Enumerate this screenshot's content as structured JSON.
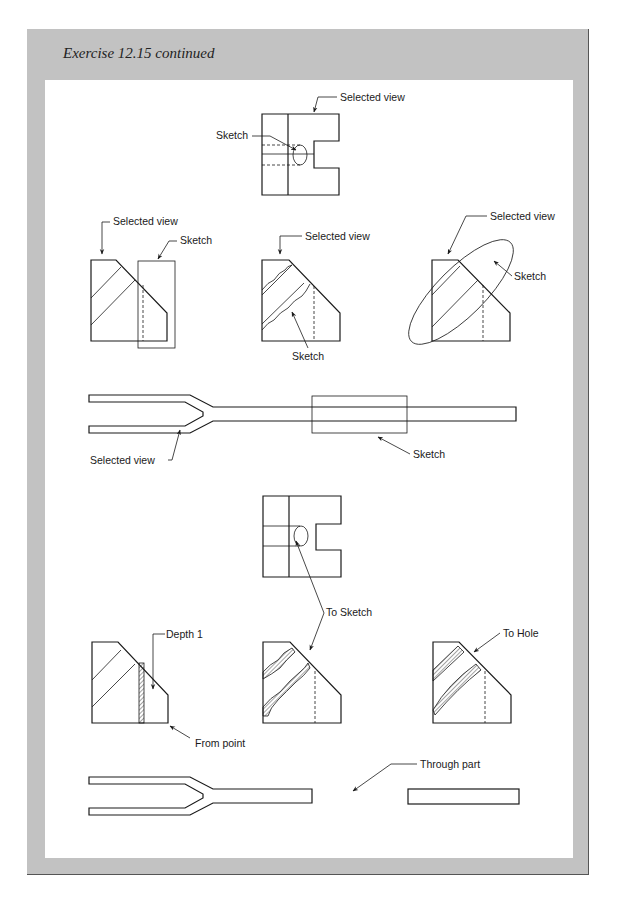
{
  "panel": {
    "title": "Exercise 12.15 continued",
    "background_color": "#c2c2c2",
    "inner_color": "#ffffff"
  },
  "figures": {
    "top_block": {
      "labels": {
        "selected_view": "Selected view",
        "sketch": "Sketch"
      }
    },
    "row1": [
      {
        "name": "rectangle-sketch-view",
        "labels": {
          "selected_view": "Selected view",
          "sketch": "Sketch"
        }
      },
      {
        "name": "irregular-sketch-view",
        "labels": {
          "selected_view": "Selected view",
          "sketch": "Sketch"
        }
      },
      {
        "name": "ellipse-sketch-view",
        "labels": {
          "selected_view": "Selected view",
          "sketch": "Sketch"
        }
      }
    ],
    "fork_top": {
      "labels": {
        "selected_view": "Selected view",
        "sketch": "Sketch"
      }
    },
    "result_block": {
      "labels": {
        "to_sketch": "To Sketch"
      }
    },
    "row2": [
      {
        "name": "depth-result-view",
        "labels": {
          "depth": "Depth 1",
          "from_point": "From point"
        }
      },
      {
        "name": "to-sketch-result-view",
        "labels": {}
      },
      {
        "name": "to-hole-result-view",
        "labels": {
          "to_hole": "To Hole"
        }
      }
    ],
    "fork_bottom": {
      "labels": {
        "through_part": "Through part"
      }
    }
  }
}
